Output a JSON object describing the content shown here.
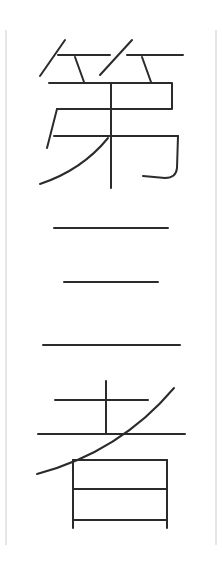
{
  "text": {
    "characters": [
      "第",
      "三",
      "者"
    ],
    "full": "第三者",
    "orientation": "vertical"
  },
  "colors": {
    "background": "#ffffff",
    "stroke": "#2b2b2b",
    "frame": "#d6d6d6"
  }
}
